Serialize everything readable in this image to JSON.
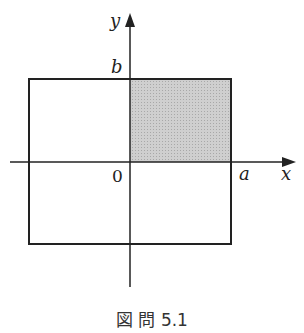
{
  "figure": {
    "caption": "図 問 5.1",
    "labels": {
      "x_axis": "x",
      "y_axis": "y",
      "origin": "0",
      "a": "a",
      "b": "b"
    },
    "colors": {
      "shade": "#c4c4c4",
      "line": "#222222"
    }
  }
}
